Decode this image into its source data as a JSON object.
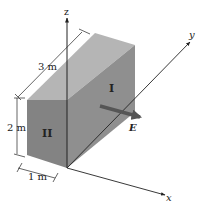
{
  "diagram": {
    "axes": {
      "x_label": "x",
      "y_label": "y",
      "z_label": "z"
    },
    "dimensions": {
      "length": "3 m",
      "height": "2 m",
      "width": "1 m"
    },
    "faces": {
      "right_face_label": "I",
      "front_face_label": "II"
    },
    "field": {
      "label": "E"
    },
    "colors": {
      "top_face": "#b5b5b5",
      "right_face": "#8f8f8f",
      "front_face": "#838383",
      "arrow": "#555555",
      "line": "#222222"
    }
  }
}
